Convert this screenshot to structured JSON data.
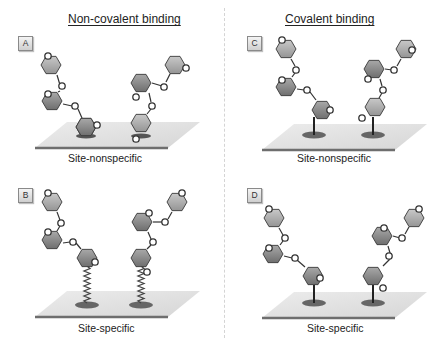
{
  "columns": [
    {
      "title": "Non-covalent binding"
    },
    {
      "title": "Covalent binding"
    }
  ],
  "panels": [
    {
      "label": "A",
      "caption": "Site-nonspecific",
      "binding": "non-covalent",
      "attachment": "adsorbed"
    },
    {
      "label": "B",
      "caption": "Site-specific",
      "binding": "non-covalent",
      "attachment": "coiled-linker"
    },
    {
      "label": "C",
      "caption": "Site-nonspecific",
      "binding": "covalent",
      "attachment": "stick"
    },
    {
      "label": "D",
      "caption": "Site-specific",
      "binding": "covalent",
      "attachment": "stick"
    }
  ],
  "ring_atom_label": "O",
  "colors": {
    "ring_dark": "#8c8c8c",
    "ring_light": "#b0b0b0",
    "ring_stroke": "#3a3a3a",
    "surface": "#e2e2e2",
    "surface_edge": "#6e6e6e",
    "anchor": "#6a6a6a",
    "divider": "#d4d4d4"
  }
}
